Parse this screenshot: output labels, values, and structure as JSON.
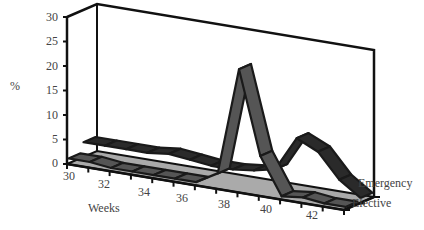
{
  "chart_data": {
    "type": "line",
    "style": "3d-ribbon",
    "title": "",
    "xlabel": "Weeks",
    "ylabel": "%",
    "ylim": [
      0,
      30
    ],
    "yticks": [
      0,
      5,
      10,
      15,
      20,
      25,
      30
    ],
    "xticks": [
      30,
      32,
      34,
      36,
      38,
      40,
      42
    ],
    "x": [
      30,
      31,
      32,
      33,
      34,
      35,
      36,
      37,
      38,
      39,
      40,
      41,
      42,
      43
    ],
    "series": [
      {
        "name": "Elective",
        "depth": "front",
        "values": [
          1,
          1,
          0.5,
          0.5,
          0.5,
          0.5,
          0.5,
          3,
          25,
          8,
          0.5,
          1,
          0.5,
          0.5
        ]
      },
      {
        "name": "Emergency",
        "depth": "back",
        "values": [
          3,
          3,
          3,
          3,
          3.5,
          3,
          2.5,
          2.5,
          3,
          4,
          11,
          9,
          4,
          1
        ]
      }
    ],
    "legend": [
      "Emergency",
      "Elective"
    ],
    "legend_position": "series axis (right, depth)",
    "grid": false
  },
  "axis": {
    "y_label": "%",
    "x_label": "Weeks",
    "y_ticks": [
      "0",
      "5",
      "10",
      "15",
      "20",
      "25",
      "30"
    ],
    "x_ticks": [
      "30",
      "32",
      "34",
      "36",
      "38",
      "40",
      "42"
    ],
    "series_labels": [
      "Emergency",
      "Elective"
    ]
  },
  "colors": {
    "ribbon_top_front": "#555555",
    "ribbon_edge": "#1a1a1a",
    "floor": "#aaaaaa",
    "axes": "#111111"
  }
}
